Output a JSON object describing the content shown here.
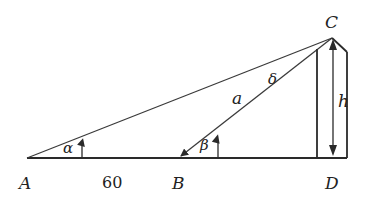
{
  "diagram": {
    "type": "geometry-triangle-height",
    "points": {
      "A": {
        "label": "A",
        "x": 27,
        "y": 158
      },
      "B": {
        "label": "B",
        "x": 180,
        "y": 158
      },
      "C": {
        "label": "C",
        "x": 332,
        "y": 38
      },
      "D": {
        "label": "D",
        "x": 332,
        "y": 158
      }
    },
    "labels": {
      "A": "A",
      "B": "B",
      "C": "C",
      "D": "D",
      "distance_AB": "60",
      "side_a": "a",
      "height": "h",
      "angle_alpha": "α",
      "angle_beta": "β",
      "angle_delta": "δ"
    },
    "colors": {
      "stroke": "#2a2a2a",
      "text": "#222222",
      "background": "#ffffff"
    }
  }
}
